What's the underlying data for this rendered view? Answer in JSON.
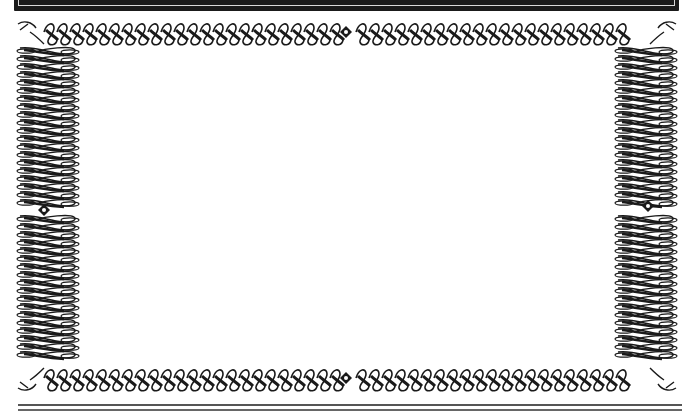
{
  "frame": {
    "style": "ornamental-scrollwork-border",
    "colors": {
      "ink": "#1a1a1a",
      "paper": "#ffffff",
      "rule": "#555555"
    },
    "ornaments": [
      "top-center-diamond",
      "bottom-center-diamond",
      "left-middle-diamond",
      "right-middle-diamond",
      "corner-flourishes"
    ]
  },
  "content": {
    "text": ""
  }
}
